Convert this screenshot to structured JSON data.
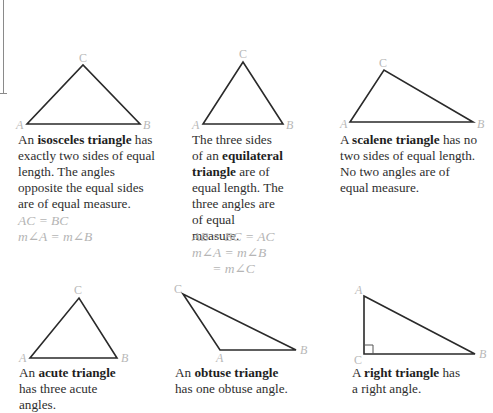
{
  "colors": {
    "line": "#2a2a2a",
    "vertex_label": "#b8b8b8",
    "equation": "#b5b5b5",
    "text": "#2e2e2e"
  },
  "triangles": [
    {
      "id": "isosceles",
      "vertices": {
        "A": [
          27,
          124
        ],
        "B": [
          140,
          124
        ],
        "C": [
          83,
          65
        ]
      },
      "labels": {
        "A": "A",
        "B": "B",
        "C": "C"
      },
      "desc": {
        "pre": "An ",
        "term": "isosceles triangle",
        "post": " has exactly two sides of equal length. The angles opposite the equal sides are of equal measure."
      },
      "equations": [
        "AC = BC",
        "m∠A = m∠B"
      ]
    },
    {
      "id": "equilateral",
      "vertices": {
        "A": [
          203,
          124
        ],
        "B": [
          283,
          124
        ],
        "C": [
          243,
          62
        ]
      },
      "labels": {
        "A": "A",
        "B": "B",
        "C": "C"
      },
      "desc": {
        "pre": "The three sides of an ",
        "term": "equilateral triangle",
        "post": " are of equal length. The three angles are of equal measure."
      },
      "equations": [
        "AB = BC = AC",
        "m∠A = m∠B",
        "      = m∠C"
      ]
    },
    {
      "id": "scalene",
      "vertices": {
        "A": [
          350,
          122
        ],
        "B": [
          473,
          122
        ],
        "C": [
          384,
          70
        ]
      },
      "labels": {
        "A": "A",
        "B": "B",
        "C": "C"
      },
      "desc": {
        "pre": "A ",
        "term": "scalene triangle",
        "post": " has no two sides of equal length. No two angles are of equal measure."
      },
      "equations": []
    },
    {
      "id": "acute",
      "vertices": {
        "A": [
          30,
          358
        ],
        "B": [
          117,
          358
        ],
        "C": [
          79,
          298
        ]
      },
      "labels": {
        "A": "A",
        "B": "B",
        "C": "C"
      },
      "desc": {
        "pre": "An ",
        "term": "acute triangle",
        "post": " has three acute angles."
      },
      "equations": []
    },
    {
      "id": "obtuse",
      "vertices": {
        "A": [
          220,
          350
        ],
        "B": [
          296,
          350
        ],
        "C": [
          183,
          294
        ]
      },
      "labels": {
        "A": "A",
        "B": "B",
        "C": "C"
      },
      "desc": {
        "pre": "An ",
        "term": "obtuse triangle",
        "post": " has one obtuse angle."
      },
      "equations": []
    },
    {
      "id": "right",
      "vertices": {
        "A": [
          364,
          296
        ],
        "B": [
          475,
          354
        ],
        "C": [
          364,
          354
        ]
      },
      "labels": {
        "A": "A",
        "B": "B",
        "C": "C"
      },
      "desc": {
        "pre": "A ",
        "term": "right triangle",
        "post": " has a right angle."
      },
      "equations": []
    }
  ]
}
